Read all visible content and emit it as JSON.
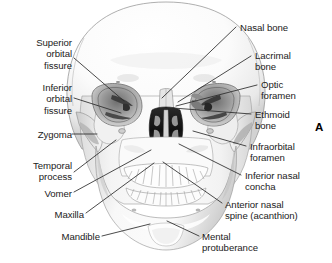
{
  "figure": {
    "panel_letter": "A",
    "background_color": "#ffffff",
    "text_color": "#1b1b1b",
    "leader_line_color": "#2a2a2a"
  },
  "labels": [
    {
      "id": "superior-orbital-fissure",
      "text": "Superior\norbital\nfissure",
      "side": "left",
      "x": 8,
      "y": 37,
      "width": 64,
      "align": "right"
    },
    {
      "id": "inferior-orbital-fissure",
      "text": "Inferior\norbital\nfissure",
      "side": "left",
      "x": 8,
      "y": 82,
      "width": 64,
      "align": "right"
    },
    {
      "id": "zygoma",
      "text": "Zygoma",
      "side": "left",
      "x": 8,
      "y": 129,
      "width": 64,
      "align": "right"
    },
    {
      "id": "temporal-process",
      "text": "Temporal\nprocess",
      "side": "left",
      "x": 8,
      "y": 160,
      "width": 64,
      "align": "right"
    },
    {
      "id": "vomer",
      "text": "Vomer",
      "side": "left",
      "x": 8,
      "y": 188,
      "width": 64,
      "align": "right"
    },
    {
      "id": "maxilla",
      "text": "Maxilla",
      "side": "left",
      "x": 20,
      "y": 209,
      "width": 64,
      "align": "right"
    },
    {
      "id": "mandible",
      "text": "Mandible",
      "side": "left",
      "x": 36,
      "y": 231,
      "width": 64,
      "align": "right"
    },
    {
      "id": "nasal-bone",
      "text": "Nasal bone",
      "side": "right",
      "x": 240,
      "y": 22,
      "width": 90,
      "align": "left"
    },
    {
      "id": "lacrimal-bone",
      "text": "Lacrimal\nbone",
      "side": "right",
      "x": 255,
      "y": 50,
      "width": 74,
      "align": "left"
    },
    {
      "id": "optic-foramen",
      "text": "Optic\nforamen",
      "side": "right",
      "x": 261,
      "y": 79,
      "width": 68,
      "align": "left"
    },
    {
      "id": "ethmoid-bone",
      "text": "Ethmoid\nbone",
      "side": "right",
      "x": 255,
      "y": 109,
      "width": 74,
      "align": "left"
    },
    {
      "id": "infraorbital-foramen",
      "text": "Infraorbital\nforamen",
      "side": "right",
      "x": 250,
      "y": 141,
      "width": 80,
      "align": "left"
    },
    {
      "id": "inferior-nasal-concha",
      "text": "Inferior nasal\nconcha",
      "side": "right",
      "x": 245,
      "y": 170,
      "width": 86,
      "align": "left"
    },
    {
      "id": "anterior-nasal-spine",
      "text": "Anterior nasal\nspine (acanthion)",
      "side": "right",
      "x": 225,
      "y": 199,
      "width": 106,
      "align": "left"
    },
    {
      "id": "mental-protuberance",
      "text": "Mental\nprotuberance",
      "side": "right",
      "x": 202,
      "y": 231,
      "width": 90,
      "align": "left"
    }
  ],
  "leader_lines": [
    {
      "id": "leader-superior-orbital-fissure",
      "x1": 74,
      "y1": 58,
      "x2": 124,
      "y2": 101
    },
    {
      "id": "leader-inferior-orbital-fissure",
      "x1": 74,
      "y1": 98,
      "x2": 121,
      "y2": 113
    },
    {
      "id": "leader-zygoma",
      "x1": 72,
      "y1": 134,
      "x2": 97,
      "y2": 134
    },
    {
      "id": "leader-temporal-process",
      "x1": 74,
      "y1": 172,
      "x2": 116,
      "y2": 140
    },
    {
      "id": "leader-vomer",
      "x1": 74,
      "y1": 192,
      "x2": 151,
      "y2": 150
    },
    {
      "id": "leader-maxilla",
      "x1": 86,
      "y1": 213,
      "x2": 154,
      "y2": 163
    },
    {
      "id": "leader-mandible",
      "x1": 102,
      "y1": 236,
      "x2": 150,
      "y2": 224
    },
    {
      "id": "leader-nasal-bone",
      "x1": 236,
      "y1": 27,
      "x2": 162,
      "y2": 98
    },
    {
      "id": "leader-lacrimal-bone",
      "x1": 251,
      "y1": 56,
      "x2": 178,
      "y2": 102
    },
    {
      "id": "leader-optic-foramen",
      "x1": 257,
      "y1": 85,
      "x2": 176,
      "y2": 106
    },
    {
      "id": "leader-ethmoid-bone",
      "x1": 251,
      "y1": 114,
      "x2": 173,
      "y2": 108
    },
    {
      "id": "leader-infraorbital-foramen",
      "x1": 246,
      "y1": 146,
      "x2": 193,
      "y2": 131
    },
    {
      "id": "leader-inferior-nasal-concha",
      "x1": 241,
      "y1": 175,
      "x2": 179,
      "y2": 144
    },
    {
      "id": "leader-anterior-nasal-spine",
      "x1": 222,
      "y1": 203,
      "x2": 163,
      "y2": 162
    },
    {
      "id": "leader-mental-protuberance",
      "x1": 199,
      "y1": 236,
      "x2": 167,
      "y2": 221
    }
  ],
  "panel_letter_position": {
    "x": 315,
    "y": 121
  }
}
